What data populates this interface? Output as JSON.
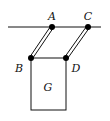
{
  "diagram": {
    "type": "mechanics-parallelogram-linkage",
    "ceiling": {
      "x1": 8,
      "y1": 27,
      "x2": 101,
      "y2": 27
    },
    "points": {
      "A": {
        "label": "A",
        "x": 52,
        "y": 27,
        "label_x": 52,
        "label_y": 20
      },
      "C": {
        "label": "C",
        "x": 88,
        "y": 27,
        "label_x": 88,
        "label_y": 20
      },
      "B": {
        "label": "B",
        "x": 31,
        "y": 58,
        "label_x": 18,
        "label_y": 72
      },
      "D": {
        "label": "D",
        "x": 66,
        "y": 58,
        "label_x": 72,
        "label_y": 72
      }
    },
    "rods": [
      {
        "name": "rod-AB",
        "from": "A",
        "to": "B",
        "style": "double-line"
      },
      {
        "name": "rod-CD",
        "from": "C",
        "to": "D",
        "style": "double-line"
      }
    ],
    "block": {
      "label": "G",
      "x": 31,
      "y": 58,
      "width": 35,
      "height": 52,
      "label_x": 48,
      "label_y": 90
    },
    "colors": {
      "line": "#111111",
      "joint": "#000000",
      "background": "#ffffff"
    }
  }
}
